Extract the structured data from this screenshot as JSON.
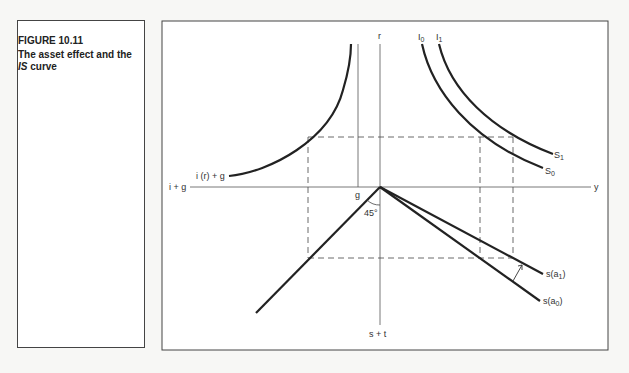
{
  "caption": {
    "figure_label": "FIGURE 10.11",
    "title_prefix": "The asset effect and the ",
    "title_italic": "IS",
    "title_suffix": " curve"
  },
  "diagram": {
    "axes": {
      "top": "r",
      "bottom": "s + t",
      "left": "i + g",
      "right": "y"
    },
    "labels": {
      "investment_curve": "i (r) + g",
      "g_line": "g",
      "angle": "45°",
      "I0": "I",
      "I0_sub": "0",
      "I1": "I",
      "I1_sub": "1",
      "S0": "S",
      "S0_sub": "0",
      "S1": "S",
      "S1_sub": "1",
      "sa1_prefix": "s(a",
      "sa1_sub": "1",
      "sa1_suffix": ")",
      "sa0_prefix": "s(a",
      "sa0_sub": "0",
      "sa0_suffix": ")"
    }
  }
}
